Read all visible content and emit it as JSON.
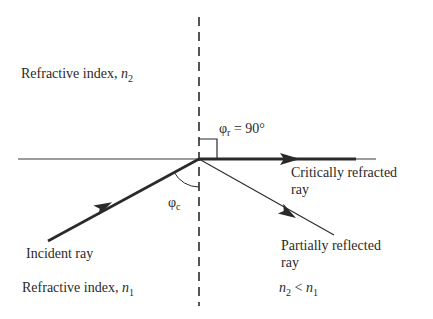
{
  "diagram": {
    "type": "critical-angle-refraction",
    "labels": {
      "upper_medium": "Refractive index, ",
      "upper_medium_symbol": "n",
      "upper_medium_sub": "2",
      "lower_medium": "Refractive index, ",
      "lower_medium_symbol": "n",
      "lower_medium_sub": "1",
      "refraction_angle_symbol": "φ",
      "refraction_angle_sub": "r",
      "refraction_angle_value": " = 90°",
      "critical_angle_symbol": "φ",
      "critical_angle_sub": "c",
      "refracted_ray_line1": "Critically refracted",
      "refracted_ray_line2": "ray",
      "reflected_ray_line1": "Partially reflected",
      "reflected_ray_line2": "ray",
      "incident_ray": "Incident ray",
      "condition_n_a": "n",
      "condition_sub_a": "2",
      "condition_op": " < ",
      "condition_n_b": "n",
      "condition_sub_b": "1"
    },
    "colors": {
      "line": "#2a2a2a",
      "background": "#ffffff"
    }
  }
}
